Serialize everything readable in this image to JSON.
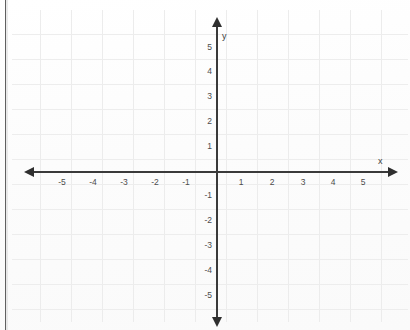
{
  "chart_data": {
    "type": "scatter",
    "title": "",
    "subtitle": "",
    "xlabel": "x",
    "ylabel": "y",
    "xlim": [
      -5.8,
      5.8
    ],
    "ylim": [
      -5.8,
      5.8
    ],
    "x_ticks": [
      -5,
      -4,
      -3,
      -2,
      -1,
      1,
      2,
      3,
      4,
      5
    ],
    "y_ticks": [
      5,
      4,
      3,
      2,
      1,
      -1,
      -2,
      -3,
      -4,
      -5
    ],
    "x_tick_labels": [
      "-5",
      "-4",
      "-3",
      "-2",
      "-1",
      "1",
      "2",
      "3",
      "4",
      "5"
    ],
    "y_tick_labels": [
      "5",
      "4",
      "3",
      "2",
      "1",
      "-1",
      "-2",
      "-3",
      "-4",
      "-5"
    ],
    "origin_label": "",
    "grid": true,
    "legend": "none",
    "series": [],
    "values": [],
    "annotations": []
  },
  "axes": {
    "x_label": "x",
    "y_label": "y",
    "x_ticks": [
      {
        "value": -5,
        "label": "-5",
        "px": 62
      },
      {
        "value": -4,
        "label": "-4",
        "px": 93
      },
      {
        "value": -3,
        "label": "-3",
        "px": 124
      },
      {
        "value": -2,
        "label": "-2",
        "px": 155
      },
      {
        "value": -1,
        "label": "-1",
        "px": 186
      },
      {
        "value": 1,
        "label": "1",
        "px": 241
      },
      {
        "value": 2,
        "label": "2",
        "px": 272
      },
      {
        "value": 3,
        "label": "3",
        "px": 303
      },
      {
        "value": 4,
        "label": "4",
        "px": 333
      },
      {
        "value": 5,
        "label": "5",
        "px": 363
      }
    ],
    "y_ticks": [
      {
        "value": 5,
        "label": "5",
        "px": 47
      },
      {
        "value": 4,
        "label": "4",
        "px": 71
      },
      {
        "value": 3,
        "label": "3",
        "px": 96
      },
      {
        "value": 2,
        "label": "2",
        "px": 121
      },
      {
        "value": 1,
        "label": "1",
        "px": 146
      },
      {
        "value": -1,
        "label": "-1",
        "px": 195
      },
      {
        "value": -2,
        "label": "-2",
        "px": 220
      },
      {
        "value": -3,
        "label": "-3",
        "px": 245
      },
      {
        "value": -4,
        "label": "-4",
        "px": 270
      },
      {
        "value": -5,
        "label": "-5",
        "px": 295
      }
    ]
  },
  "grid": {
    "vertical_px": [
      40,
      71,
      102,
      133,
      164,
      195,
      226,
      257,
      288,
      319,
      350,
      381
    ],
    "horizontal_px": [
      34,
      59,
      84,
      109,
      134,
      159,
      184,
      209,
      234,
      259,
      284,
      309
    ]
  },
  "colors": {
    "axis": "#3a3a3a",
    "arrowhead": "#2f2f2f",
    "gridline": "#ececec",
    "tick_text": "#4c4c4c",
    "background": "#fdfdfd",
    "scan_edge": "#4a4a4a"
  }
}
